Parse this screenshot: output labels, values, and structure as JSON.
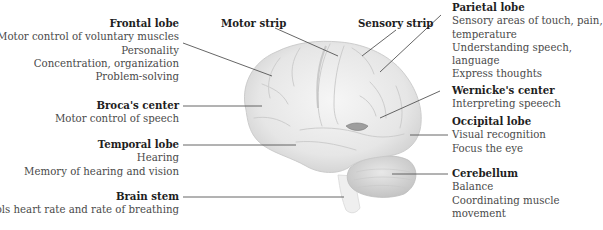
{
  "diagram": {
    "labels": {
      "frontal_lobe": {
        "title": "Frontal lobe",
        "lines": [
          "Motor control of voluntary muscles",
          "Personality",
          "Concentration, organization",
          "Problem-solving"
        ]
      },
      "brocas_center": {
        "title": "Broca's center",
        "lines": [
          "Motor control of speech"
        ]
      },
      "temporal_lobe": {
        "title": "Temporal lobe",
        "lines": [
          "Hearing",
          "Memory of hearing and vision"
        ]
      },
      "brain_stem": {
        "title": "Brain stem",
        "lines": [
          "Controls heart rate and rate of breathing"
        ]
      },
      "motor_strip": {
        "title": "Motor strip"
      },
      "sensory_strip": {
        "title": "Sensory strip"
      },
      "parietal_lobe": {
        "title": "Parietal lobe",
        "lines": [
          "Sensory areas of touch, pain,",
          "temperature",
          "Understanding speech,",
          "language",
          "Express thoughts"
        ]
      },
      "wernickes_center": {
        "title": "Wernicke's center",
        "lines": [
          "Interpreting speeech"
        ]
      },
      "occipital_lobe": {
        "title": "Occipital lobe",
        "lines": [
          "Visual recognition",
          "Focus the eye"
        ]
      },
      "cerebellum": {
        "title": "Cerebellum",
        "lines": [
          "Balance",
          "Coordinating muscle",
          "movement"
        ]
      }
    },
    "colors": {
      "leader_line": "#555555",
      "brain_fill": "#ececec",
      "brain_shadow": "#cfcfcf",
      "text_title": "#1e1e1e",
      "text_body": "#4a4a4a"
    }
  }
}
